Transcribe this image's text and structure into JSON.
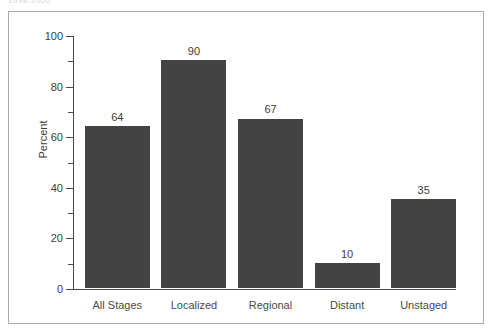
{
  "scan": {
    "clipped_top_text": "1998-2000"
  },
  "chart_data": {
    "type": "bar",
    "title": "",
    "xlabel": "",
    "ylabel": "Percent",
    "categories": [
      "All Stages",
      "Localized",
      "Regional",
      "Distant",
      "Unstaged"
    ],
    "values": [
      64,
      90,
      67,
      10,
      35
    ],
    "value_labels": [
      "64",
      "90",
      "67",
      "10",
      "35"
    ],
    "ylim": [
      0,
      100
    ],
    "yticks": [
      0,
      20,
      40,
      60,
      80,
      100
    ],
    "ytick_labels": [
      "0",
      "20",
      "40",
      "60",
      "80",
      "100"
    ],
    "yminor_ticks": [
      10,
      30,
      50,
      70,
      90
    ],
    "grid": false,
    "legend": null,
    "bar_color": "#434343",
    "axis_color": "#4a4a4a",
    "frame_color": "#a9adb1",
    "text_color": "#3b3b3b",
    "background": "#ffffff"
  }
}
